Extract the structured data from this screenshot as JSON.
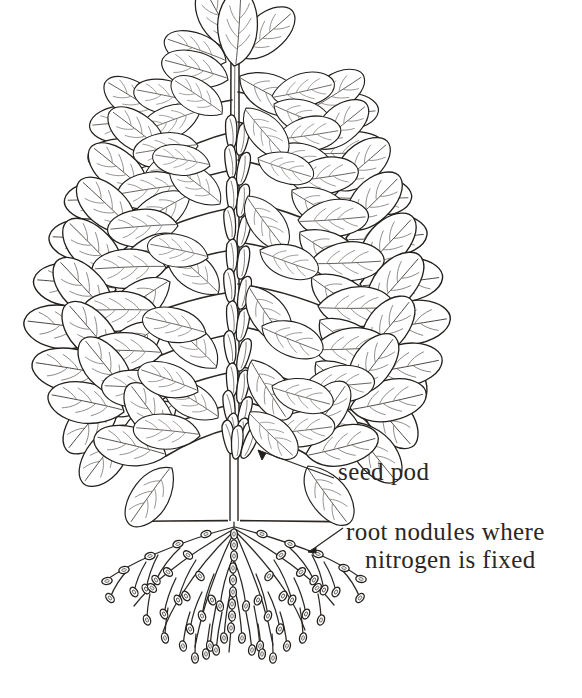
{
  "figure": {
    "kind": "botanical-line-drawing",
    "background_color": "#ffffff",
    "ink_color": "#231f1c",
    "width": 582,
    "height": 698
  },
  "labels": {
    "seed_pod": {
      "text": "seed pod",
      "leader": "arrow pointing up-left to a pod on the lower stem"
    },
    "root_nodules": {
      "line1": "root nodules where",
      "line2": "nitrogen is fixed",
      "leader": "short arrow pointing down-left to a nodule on a root"
    }
  },
  "parts": {
    "canopy": "dense trifoliate foliage, roughly triangular, widest near the base",
    "stem": "single erect central stem densely hung with elongated seed pods",
    "soil_line": "horizontal ground line crossing the stem",
    "roots": "branching taproot system below the soil line bearing many oval nodules"
  }
}
